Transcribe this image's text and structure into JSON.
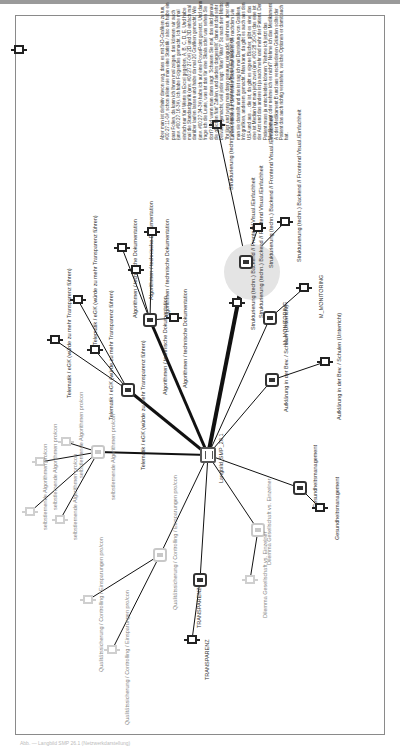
{
  "page": {
    "caption": "Abb. — Langbild SMP 26.1 (Netzwerkdarstellung)"
  },
  "text_block": {
    "content": "Aber man ist definitiv davon weg, dass es mit 3-D-Grafiken zu tun, #00:27:11-0#, schon allein wie man eine Statistik / also ich habe ein paar Folien, da kann ich Ihnen mal zeigen, das können wir auch (unv. #00:27:16-3#). Ich habe Folgendes gemacht. Ich habe mal einfach nur fünf Werte in Excel gegeben, A, B, C, D, E. Und habe mal die Standardgrafik (unv. #00:27:27-0#) 2D und 3D einfach mal darüber laufen lassen und habe da mal 20 Grafiken gemacht. Wie (unv. #00:27:34-3#) habe ich auf eine PowerPoint gesetzt. Und dann frage ich die Leute, was ist das für eine Skala oder was sehen Sie dort? Und wenn man dann sagt: 'Schauen Sie mal, das sind genau die gleichen fünf Zahlen, und anders dargestellt', dann ist das sehr bewusst gemacht, weil jeder sagt: 'Was? Was?' So nach dem Motto: 'Ihr lügt' und wenn man dann genauer reinguckt, sieht man, aber die Zahlen wirken auf den ersten Blick total anders. Je nachdem wie man sie darstellt und das ist sag ich mal Darstellung von Grafiken, Infografiken, anderem gemacht. Man kann, da gibt es auch aus den USA und aus ... die ist, da gibt es eigene Bücher, gibt es eine, das eine ist Median hat man jetzt zwei (unv. #00:28:16-0#) das eine ist der Arzt und das andere ist ja auch mehr und mehr der Patient. Der Patient muss ja entscheiden können: 'Nehme ich jetzt das Medikament oder nehme ich es nicht?' Nehme ich das Medikament A oder Medikament B und aus verschiedenen Gründen sollte der Patient das auch richtig verstehen, welche Optionen er damit auch hat."
  },
  "hub": {
    "id": "center",
    "label": "Langbild_SMP_26.1",
    "x": 208,
    "y": 455
  },
  "halo": {
    "x": 252,
    "y": 272,
    "r": 28
  },
  "nodes": [
    {
      "id": "text-anchor",
      "type": "leaf",
      "x": 19,
      "y": 50,
      "label": ""
    },
    {
      "id": "tel-hub",
      "type": "hub",
      "x": 128,
      "y": 390,
      "label": "Telematik / eGK (würde zu mehr Transparenz führen)",
      "lx": 140,
      "ly": 470
    },
    {
      "id": "tel-1",
      "type": "leaf",
      "x": 78,
      "y": 300,
      "label": "Telematik / eGK (würde zu mehr Transparenz führen)",
      "lx": 92,
      "ly": 345
    },
    {
      "id": "tel-2",
      "type": "leaf",
      "x": 55,
      "y": 340,
      "label": "Telematik / eGK (würde zu mehr Transparenz führen)",
      "lx": 66,
      "ly": 398
    },
    {
      "id": "tel-3",
      "type": "leaf",
      "x": 95,
      "y": 350,
      "label": "Telematik / eGK (würde zu mehr Transparenz führen)",
      "lx": 108,
      "ly": 420
    },
    {
      "id": "alg-hub",
      "type": "hub",
      "x": 150,
      "y": 320,
      "label": "Algorithmen / technische Dokumentation",
      "lx": 162,
      "ly": 395
    },
    {
      "id": "alg-1",
      "type": "leaf",
      "x": 122,
      "y": 248,
      "label": "Algorithmen / technische Dokumentation",
      "lx": 132,
      "ly": 318
    },
    {
      "id": "alg-2",
      "type": "leaf",
      "x": 136,
      "y": 270,
      "label": "Algorithmen / technische Dokumentation",
      "lx": 148,
      "ly": 300
    },
    {
      "id": "alg-3",
      "type": "leaf",
      "x": 152,
      "y": 232,
      "label": "Algorithmen / technische Dokumentation",
      "lx": 164,
      "ly": 318
    },
    {
      "id": "alg-4",
      "type": "leaf",
      "x": 174,
      "y": 318,
      "label": "Algorithmen / technische Dokumentation",
      "lx": 182,
      "ly": 388
    },
    {
      "id": "str-hub",
      "type": "hub",
      "x": 246,
      "y": 262,
      "label": "Strukturierung (techn.) Backend // Frontend Visual./Einfachheit",
      "lx": 258,
      "ly": 318
    },
    {
      "id": "str-1",
      "type": "leaf",
      "x": 237,
      "y": 303,
      "label": "Strukturierung (techn.) Backend // Frontend Visual./Einfachheit",
      "lx": 250,
      "ly": 330
    },
    {
      "id": "str-2",
      "type": "leaf",
      "x": 258,
      "y": 228,
      "label": "Strukturierung (techn.) Backend // Frontend Visual./Einfachheit",
      "lx": 268,
      "ly": 268
    },
    {
      "id": "str-3",
      "type": "leaf",
      "x": 285,
      "y": 222,
      "label": "Strukturierung (techn.) Backend // Frontend Visual./Einfachheit",
      "lx": 296,
      "ly": 262
    },
    {
      "id": "str-4",
      "type": "leaf",
      "x": 217,
      "y": 125,
      "label": "Strukturierung (techn.) Backend // Frontend Visual./Einfachheit",
      "lx": 228,
      "ly": 190
    },
    {
      "id": "mon-hub",
      "type": "hub",
      "x": 270,
      "y": 318,
      "label": "M_MONITORING",
      "lx": 282,
      "ly": 345
    },
    {
      "id": "mon-1",
      "type": "leaf",
      "x": 304,
      "y": 288,
      "label": "M_MONITORING",
      "lx": 318,
      "ly": 318
    },
    {
      "id": "auf-hub",
      "type": "hub",
      "x": 272,
      "y": 380,
      "label": "Aufklärung in der Bev. / Schulen (Unterricht)",
      "lx": 283,
      "ly": 412
    },
    {
      "id": "auf-1",
      "type": "leaf",
      "x": 325,
      "y": 362,
      "label": "Aufklärung in der Bev. / Schulen (Unterricht)",
      "lx": 336,
      "ly": 420
    },
    {
      "id": "ges-hub",
      "type": "hub",
      "x": 300,
      "y": 488,
      "label": "Gesundheitsmanagement",
      "lx": 312,
      "ly": 508
    },
    {
      "id": "ges-1",
      "type": "leaf",
      "x": 320,
      "y": 508,
      "label": "Gesundheitsmanagement",
      "lx": 334,
      "ly": 540
    },
    {
      "id": "dil-hub",
      "type": "hub",
      "x": 258,
      "y": 530,
      "label": "Dilemma Gesellschaft vs. Einzelner",
      "lx": 266,
      "ly": 565,
      "faded": true
    },
    {
      "id": "dil-1",
      "type": "leaf",
      "x": 250,
      "y": 580,
      "label": "Dilemma Gesellschaft vs. Einzelner",
      "lx": 262,
      "ly": 618,
      "faded": true
    },
    {
      "id": "tra-hub",
      "type": "hub",
      "x": 200,
      "y": 580,
      "label": "TRANSPARENZ",
      "lx": 196,
      "ly": 628
    },
    {
      "id": "tra-1",
      "type": "leaf",
      "x": 192,
      "y": 640,
      "label": "TRANSPARENZ",
      "lx": 204,
      "ly": 680
    },
    {
      "id": "qual-hub",
      "type": "hub",
      "x": 160,
      "y": 555,
      "label": "Qualitätssicherung / Controlling / Einsparungen pro/con",
      "lx": 172,
      "ly": 610,
      "faded": true
    },
    {
      "id": "qual-1",
      "type": "leaf",
      "x": 88,
      "y": 600,
      "label": "Qualitätssicherung / Controlling / Einsparungen pro/con",
      "lx": 98,
      "ly": 672,
      "faded": true
    },
    {
      "id": "qual-2",
      "type": "leaf",
      "x": 112,
      "y": 650,
      "label": "Qualitätssicherung / Controlling / Einsparungen pro/con",
      "lx": 124,
      "ly": 725,
      "faded": true
    },
    {
      "id": "sel-hub",
      "type": "hub",
      "x": 98,
      "y": 452,
      "label": "selbstlernende Algorithmen pro/con",
      "lx": 110,
      "ly": 500,
      "faded": true
    },
    {
      "id": "sel-1",
      "type": "leaf",
      "x": 40,
      "y": 462,
      "label": "selbstlernende Algorithmen pro/con",
      "lx": 52,
      "ly": 510,
      "faded": true
    },
    {
      "id": "sel-2",
      "type": "leaf",
      "x": 66,
      "y": 442,
      "label": "selbstlernende Algorithmen pro/con",
      "lx": 78,
      "ly": 478,
      "faded": true
    },
    {
      "id": "sel-3",
      "type": "leaf",
      "x": 30,
      "y": 512,
      "label": "selbstlernende Algorithmen pro/con",
      "lx": 42,
      "ly": 530,
      "faded": true
    },
    {
      "id": "sel-4",
      "type": "leaf",
      "x": 60,
      "y": 520,
      "label": "selbstlernende Algorithmen pro/con",
      "lx": 72,
      "ly": 540,
      "faded": true
    }
  ],
  "edges": [
    {
      "from": "center",
      "to": "tel-hub",
      "w": 3
    },
    {
      "from": "center",
      "to": "alg-hub",
      "w": 3
    },
    {
      "from": "center",
      "to": "str-hub",
      "w": 4
    },
    {
      "from": "center",
      "to": "mon-hub",
      "w": 1
    },
    {
      "from": "center",
      "to": "auf-hub",
      "w": 1
    },
    {
      "from": "center",
      "to": "ges-hub",
      "w": 1
    },
    {
      "from": "center",
      "to": "dil-hub",
      "w": 1
    },
    {
      "from": "center",
      "to": "tra-hub",
      "w": 1
    },
    {
      "from": "center",
      "to": "qual-hub",
      "w": 1
    },
    {
      "from": "center",
      "to": "sel-hub",
      "w": 2
    },
    {
      "from": "tel-hub",
      "to": "tel-1",
      "w": 1
    },
    {
      "from": "tel-hub",
      "to": "tel-2",
      "w": 1
    },
    {
      "from": "tel-hub",
      "to": "tel-3",
      "w": 1
    },
    {
      "from": "alg-hub",
      "to": "alg-1",
      "w": 1
    },
    {
      "from": "alg-hub",
      "to": "alg-2",
      "w": 1
    },
    {
      "from": "alg-hub",
      "to": "alg-3",
      "w": 1
    },
    {
      "from": "alg-hub",
      "to": "alg-4",
      "w": 1
    },
    {
      "from": "str-hub",
      "to": "str-1",
      "w": 1
    },
    {
      "from": "str-hub",
      "to": "str-2",
      "w": 1
    },
    {
      "from": "str-hub",
      "to": "str-3",
      "w": 1
    },
    {
      "from": "str-hub",
      "to": "str-4",
      "w": 1
    },
    {
      "from": "mon-hub",
      "to": "mon-1",
      "w": 1
    },
    {
      "from": "auf-hub",
      "to": "auf-1",
      "w": 1
    },
    {
      "from": "ges-hub",
      "to": "ges-1",
      "w": 1
    },
    {
      "from": "dil-hub",
      "to": "dil-1",
      "w": 1
    },
    {
      "from": "tra-hub",
      "to": "tra-1",
      "w": 1
    },
    {
      "from": "qual-hub",
      "to": "qual-1",
      "w": 1
    },
    {
      "from": "qual-hub",
      "to": "qual-2",
      "w": 1
    },
    {
      "from": "sel-hub",
      "to": "sel-1",
      "w": 1
    },
    {
      "from": "sel-hub",
      "to": "sel-2",
      "w": 1
    },
    {
      "from": "sel-hub",
      "to": "sel-3",
      "w": 1
    },
    {
      "from": "sel-hub",
      "to": "sel-4",
      "w": 1
    }
  ]
}
